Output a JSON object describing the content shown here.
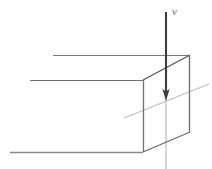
{
  "figure": {
    "kind": "line-diagram",
    "title": "",
    "background_color": "#ffffff",
    "width": 212,
    "height": 169,
    "labels": {
      "velocity": "v"
    },
    "colors": {
      "edge_dark": "#4a4a4a",
      "edge_mid": "#6e6e6e",
      "edge_light": "#9a9a9a",
      "axis_light": "#c2c2c2",
      "arrow": "#3d3d3d",
      "label": "#6b6b6b"
    },
    "shapes": {
      "box": {
        "name": "rectangular-prism",
        "front_face": {
          "top_left": [
            143,
            80
          ],
          "top_right": [
            190,
            55
          ],
          "bottom_right": [
            190,
            132
          ],
          "bottom_left": [
            143,
            152
          ]
        },
        "receding_edges": {
          "top_back": [
            [
              53,
              55
            ],
            [
              190,
              55
            ]
          ],
          "top_front": [
            [
              30,
              80
            ],
            [
              143,
              80
            ]
          ],
          "bottom_front": [
            [
              10,
              152
            ],
            [
              143,
              152
            ]
          ]
        }
      },
      "arrow": {
        "name": "downward-velocity-arrow",
        "from": [
          166,
          12
        ],
        "to": [
          166,
          100
        ],
        "head_width": 7,
        "head_length": 11
      },
      "axis_line_vertical": {
        "from": [
          166,
          100
        ],
        "to": [
          166,
          169
        ]
      },
      "axis_line_diagonal": {
        "from": [
          124,
          118
        ],
        "to": [
          209,
          84
        ]
      }
    }
  }
}
